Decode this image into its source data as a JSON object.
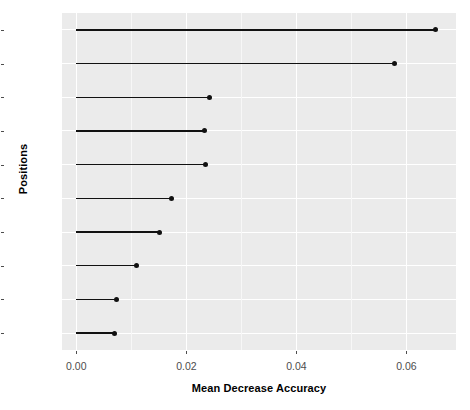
{
  "chart_data": {
    "type": "bar",
    "subtype": "lollipop-horizontal",
    "title": "",
    "xlabel": "Mean Decrease Accuracy",
    "ylabel": "Positions",
    "categories": [
      "P54",
      "P46",
      "P82",
      "P33",
      "P10",
      "P71",
      "P84",
      "P76",
      "P47",
      "P32"
    ],
    "values": [
      0.0653,
      0.0578,
      0.0242,
      0.0233,
      0.0235,
      0.0173,
      0.0151,
      0.0109,
      0.0073,
      0.0069
    ],
    "xlim": [
      -0.0026,
      0.069
    ],
    "ylim_categories_order_top_to_bottom": [
      "P54",
      "P46",
      "P82",
      "P33",
      "P10",
      "P71",
      "P84",
      "P76",
      "P47",
      "P32"
    ],
    "x_ticks": [
      0.0,
      0.02,
      0.04,
      0.06
    ],
    "x_tick_labels": [
      "0.00",
      "0.02",
      "0.04",
      "0.06"
    ],
    "grid": true,
    "grid_major_color": "#ffffff",
    "grid_minor_color": "#f7f7f7",
    "panel_background": "#ebebeb",
    "series_color": "#111111",
    "legend": "none"
  },
  "axes": {
    "y_title": "Positions",
    "x_title": "Mean Decrease Accuracy"
  }
}
